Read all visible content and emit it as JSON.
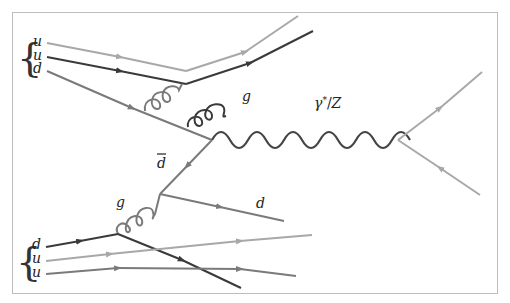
{
  "colors": {
    "light_quark": "#a8a8a8",
    "mid_quark": "#7a7a7a",
    "dark_quark": "#3a3a3a",
    "boson": "#444444",
    "frame": "#bdbdbd"
  },
  "labels": {
    "top_proton": [
      "u",
      "u",
      "d"
    ],
    "bottom_proton": [
      "d",
      "u",
      "u"
    ],
    "gluon_top": "g",
    "gluon_bottom": "g",
    "antiquark": "d̄",
    "outgoing_quark": "d",
    "boson": "γ*/Z"
  },
  "particles": {
    "incoming_top": [
      "u",
      "u",
      "d"
    ],
    "incoming_bottom": [
      "d",
      "u",
      "u"
    ],
    "propagators": [
      {
        "type": "gluon",
        "label": "g",
        "where": "top proton, radiated from d quark"
      },
      {
        "type": "gluon",
        "label": "g",
        "where": "bottom proton, from d quark"
      },
      {
        "type": "quark",
        "label": "d̄",
        "where": "from gluon splitting to annihilation vertex"
      },
      {
        "type": "boson",
        "label": "γ*/Z",
        "where": "s-channel to lepton pair"
      }
    ],
    "outgoing": [
      "d",
      "lepton",
      "antilepton"
    ]
  }
}
